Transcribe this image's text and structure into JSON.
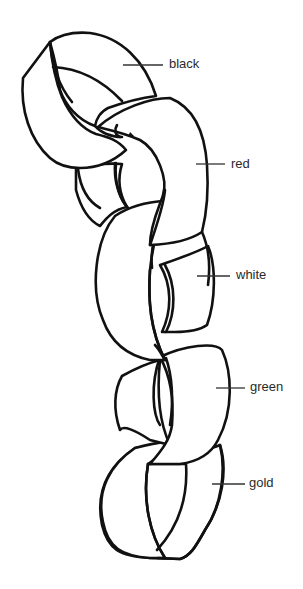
{
  "diagram": {
    "links": [
      {
        "label": "black",
        "leader": {
          "x1": 123,
          "x2": 163,
          "y": 65
        },
        "text_pos": {
          "x": 169,
          "y": 57
        }
      },
      {
        "label": "red",
        "leader": {
          "x1": 196,
          "x2": 225,
          "y": 164
        },
        "text_pos": {
          "x": 231,
          "y": 157
        }
      },
      {
        "label": "white",
        "leader": {
          "x1": 197,
          "x2": 230,
          "y": 276
        },
        "text_pos": {
          "x": 236,
          "y": 268
        }
      },
      {
        "label": "green",
        "leader": {
          "x1": 216,
          "x2": 245,
          "y": 388
        },
        "text_pos": {
          "x": 250,
          "y": 380
        }
      },
      {
        "label": "gold",
        "leader": {
          "x1": 212,
          "x2": 245,
          "y": 484
        },
        "text_pos": {
          "x": 249,
          "y": 476
        }
      }
    ],
    "line_color": "#111111",
    "background": "#ffffff"
  }
}
